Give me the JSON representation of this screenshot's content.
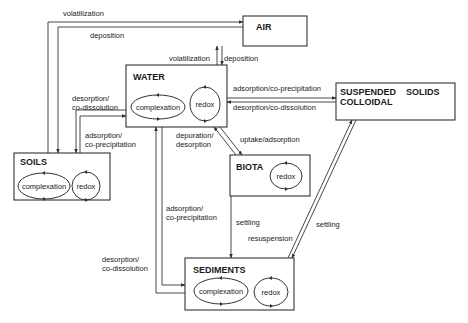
{
  "compartments": {
    "air": {
      "title": "AIR"
    },
    "water": {
      "title": "WATER",
      "processes": [
        "complexation",
        "redox"
      ]
    },
    "suspended": {
      "title_line1": "SUSPENDED    SOLIDS",
      "title_line2": "COLLOIDAL"
    },
    "soils": {
      "title": "SOILS",
      "processes": [
        "complexation",
        "redox"
      ]
    },
    "biota": {
      "title": "BIOTA",
      "processes": [
        "redox"
      ]
    },
    "sediments": {
      "title": "SEDIMENTS",
      "processes": [
        "complexation",
        "redox"
      ]
    }
  },
  "flows": {
    "soils_air_volatilization": "volatilization",
    "air_soils_deposition": "deposition",
    "water_air_volatilization": "volatilization",
    "air_water_deposition": "deposition",
    "water_soils_desorption_l1": "desorption/",
    "water_soils_desorption_l2": "co-dissolution",
    "soils_water_adsorption_l1": "adsorption/",
    "soils_water_adsorption_l2": "co-precipitation",
    "water_suspended_adsorption": "adsorption/co-precipitation",
    "suspended_water_desorption": "desorption/co-dissolution",
    "biota_water_depuration_l1": "depuration/",
    "biota_water_depuration_l2": "desorption",
    "water_biota_uptake": "uptake/adsorption",
    "water_sediments_adsorption_l1": "adsorption/",
    "water_sediments_adsorption_l2": "co-precipitation",
    "sediments_water_desorption_l1": "desorption/",
    "sediments_water_desorption_l2": "co-dissolution",
    "biota_sediments_settling": "settling",
    "sediments_suspended_resuspension": "resuspension",
    "suspended_sediments_settling": "settling"
  }
}
